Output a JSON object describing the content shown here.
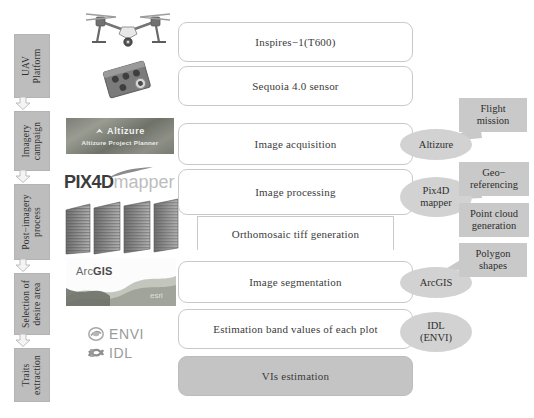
{
  "figure": {
    "colors": {
      "stage_fill": "#bdbdbd",
      "box_border": "#c9c9c9",
      "box_fill": "#ffffff",
      "filled_box": "#c4c4c4",
      "ellipse_fill": "#d2d2d2",
      "callout_fill": "#c9c9c9",
      "background": "#ffffff"
    }
  },
  "stages": [
    {
      "id": "uav-platform",
      "lines": [
        "UAV",
        "Platform"
      ]
    },
    {
      "id": "imagery-campaign",
      "lines": [
        "Imagery",
        "campaign"
      ]
    },
    {
      "id": "post-imagery",
      "lines": [
        "Post−imagery",
        "process"
      ]
    },
    {
      "id": "selection-area",
      "lines": [
        "Selection of",
        "desire area"
      ]
    },
    {
      "id": "traits-extraction",
      "lines": [
        "Traits",
        "extraction"
      ]
    }
  ],
  "flow_steps": [
    {
      "id": "inspires",
      "label": "Inspires−1(T600)"
    },
    {
      "id": "sequoia",
      "label": "Sequoia 4.0 sensor"
    },
    {
      "id": "image-acq",
      "label": "Image acquisition"
    },
    {
      "id": "image-proc",
      "label": "Image processing"
    },
    {
      "id": "orthomosaic",
      "label": "Orthomosaic tiff generation"
    },
    {
      "id": "segmentation",
      "label": "Image segmentation"
    },
    {
      "id": "band-values",
      "label": "Estimation band values of each plot"
    },
    {
      "id": "vis-estimation",
      "label": "VIs estimation"
    }
  ],
  "software": [
    {
      "id": "altizure",
      "lines": [
        "Altizure"
      ]
    },
    {
      "id": "pix4d",
      "lines": [
        "Pix4D",
        "mapper"
      ]
    },
    {
      "id": "arcgis",
      "lines": [
        "ArcGIS"
      ]
    },
    {
      "id": "idl-envi",
      "lines": [
        "IDL",
        "(ENVI)"
      ]
    }
  ],
  "callouts": [
    {
      "id": "flight-mission",
      "lines": [
        "Flight",
        "mission"
      ]
    },
    {
      "id": "geo-referencing",
      "lines": [
        "Geo−",
        "referencing"
      ]
    },
    {
      "id": "point-cloud",
      "lines": [
        "Point cloud",
        "generation"
      ]
    },
    {
      "id": "polygon-shapes",
      "lines": [
        "Polygon",
        "shapes"
      ]
    }
  ],
  "logos": {
    "altizure": {
      "title": "Altizure",
      "subtitle": "Altizure Project Planner"
    },
    "pix4d": {
      "part1": "P",
      "part2": "IX",
      "part3": "4D",
      "part4": "mapper"
    },
    "arcgis": {
      "prefix": "Arc",
      "suffix": "GIS",
      "watermark": "esri"
    },
    "envi": {
      "name": "ENVI"
    },
    "idl": {
      "name": "IDL"
    }
  },
  "imagery": {
    "drone": "dji-inspire-drone-photo",
    "sensor": "parrot-sequoia-sensor-photo",
    "orthomosaic_tiles": "stacked-orthomosaic-image-tiles"
  }
}
